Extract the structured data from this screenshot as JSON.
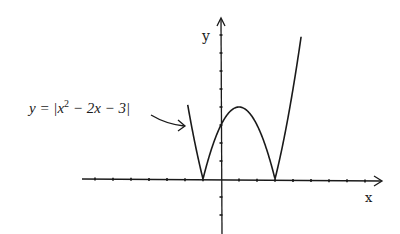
{
  "figure": {
    "type": "function-graph",
    "equation_label": {
      "prefix": "y = |x",
      "superscript": "2",
      "suffix": " − 2x − 3|"
    },
    "x_axis_label": "x",
    "y_axis_label": "y",
    "function": "y = |x^2 - 2x - 3|",
    "x_intercepts": [
      -1,
      3
    ],
    "y_intercept": 3,
    "local_max": {
      "x": 1,
      "y": 4
    },
    "x_ticks": [
      -7,
      -6,
      -5,
      -4,
      -3,
      -2,
      -1,
      1,
      2,
      3,
      4,
      5,
      6,
      7,
      8,
      9
    ],
    "y_ticks": [
      -3,
      -2,
      -1,
      1,
      2,
      3,
      4,
      5,
      6,
      7,
      8
    ],
    "plot_domain": [
      -1.85,
      4.45
    ],
    "colors": {
      "ink": "#1a1a1a",
      "background": "#ffffff"
    }
  },
  "chart_data": {
    "type": "line",
    "xlabel": "x",
    "ylabel": "y",
    "x": [
      -1.85,
      -1.5,
      -1,
      -0.5,
      0,
      0.5,
      1,
      1.5,
      2,
      2.5,
      3,
      3.5,
      4,
      4.45
    ],
    "series": [
      {
        "name": "y = |x^2 - 2x - 3|",
        "values": [
          7.12,
          5.25,
          0,
          1.75,
          3,
          3.75,
          4,
          3.75,
          3,
          1.75,
          0,
          2.25,
          5,
          7.9
        ]
      }
    ],
    "xlim": [
      -7.5,
      9.2
    ],
    "ylim": [
      -3,
      9
    ],
    "grid": false,
    "legend": "none (annotation with arrow at left)"
  }
}
